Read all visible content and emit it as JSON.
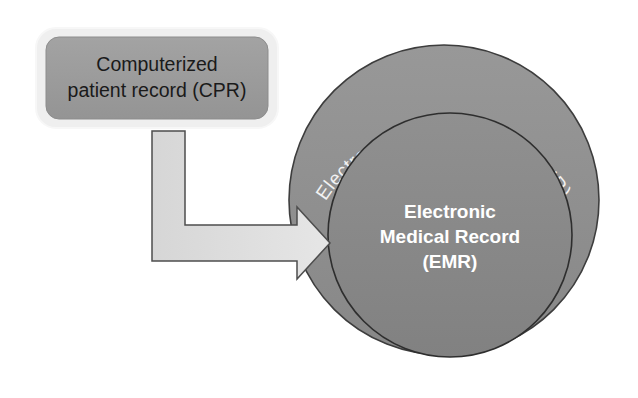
{
  "diagram": {
    "background_color": "#ffffff",
    "cpr_box": {
      "line1": "Computerized",
      "line2": "patient record (CPR)",
      "fill_color": "#9b9b9b",
      "glow_color": "#e8e8e8",
      "text_color": "#1a1a1a"
    },
    "arrow": {
      "label": "",
      "fill_color": "#dcdcdc",
      "stroke_color": "#4a4a4a",
      "direction": "elbow-down-right"
    },
    "outer_circle": {
      "label": "Electronic Health Record (EHR)",
      "fill_color": "#8e8e8e",
      "stroke_color": "#3d3d3d",
      "text_color": "#f2f2f2"
    },
    "inner_circle": {
      "line1": "Electronic",
      "line2": "Medical Record",
      "line3": "(EMR)",
      "fill_color": "#878787",
      "stroke_color": "#2e2e2e",
      "text_color": "#ffffff"
    }
  }
}
